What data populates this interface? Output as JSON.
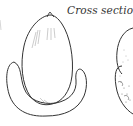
{
  "figure": {
    "label": "Cross section",
    "colors": {
      "ink": "#333333",
      "background": "#ffffff"
    }
  }
}
